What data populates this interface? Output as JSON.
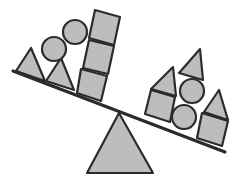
{
  "diagram": {
    "type": "balance-scale",
    "colors": {
      "fill": "#bdbdbd",
      "stroke": "#2b2b2b",
      "background": "#ffffff"
    },
    "left_side": {
      "shapes": [
        "triangle",
        "triangle",
        "circle",
        "circle",
        "square",
        "square",
        "square"
      ]
    },
    "right_side": {
      "shapes": [
        "triangle",
        "triangle",
        "triangle",
        "circle",
        "circle",
        "square",
        "square"
      ]
    }
  }
}
